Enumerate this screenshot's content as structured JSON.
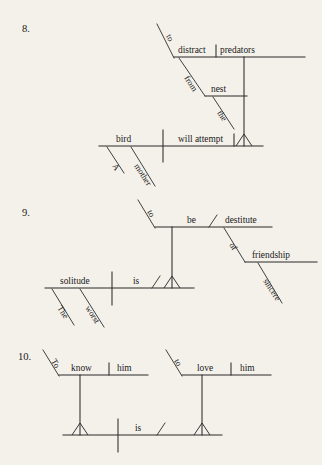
{
  "page": {
    "background_color": "#f4f1ea",
    "ink_color": "#2b2b2b",
    "text_color": "#1a1a1a"
  },
  "exercises": [
    {
      "number": "8.",
      "sentence": "A mother bird will attempt to distract predators from the nest.",
      "words": {
        "subject": "bird",
        "subject_modifier_article": "A",
        "subject_modifier_adjective": "mother",
        "verb": "will attempt",
        "infinitive_marker": "to",
        "infinitive_verb": "distract",
        "infinitive_object": "predators",
        "preposition": "from",
        "prep_object": "nest",
        "prep_object_article": "the"
      }
    },
    {
      "number": "9.",
      "sentence": "The worst solitude is to be destitute of sincere friendship.",
      "words": {
        "subject": "solitude",
        "subject_modifier_article": "The",
        "subject_modifier_adjective": "worst",
        "verb": "is",
        "infinitive_marker": "to",
        "infinitive_verb": "be",
        "predicate_adjective": "destitute",
        "preposition": "of",
        "prep_object": "friendship",
        "prep_object_modifier": "sincere"
      }
    },
    {
      "number": "10.",
      "sentence": "To know him is to love him.",
      "words": {
        "subject_infinitive_marker": "To",
        "subject_infinitive_verb": "know",
        "subject_infinitive_object": "him",
        "verb": "is",
        "complement_infinitive_marker": "to",
        "complement_infinitive_verb": "love",
        "complement_infinitive_object": "him"
      }
    }
  ]
}
